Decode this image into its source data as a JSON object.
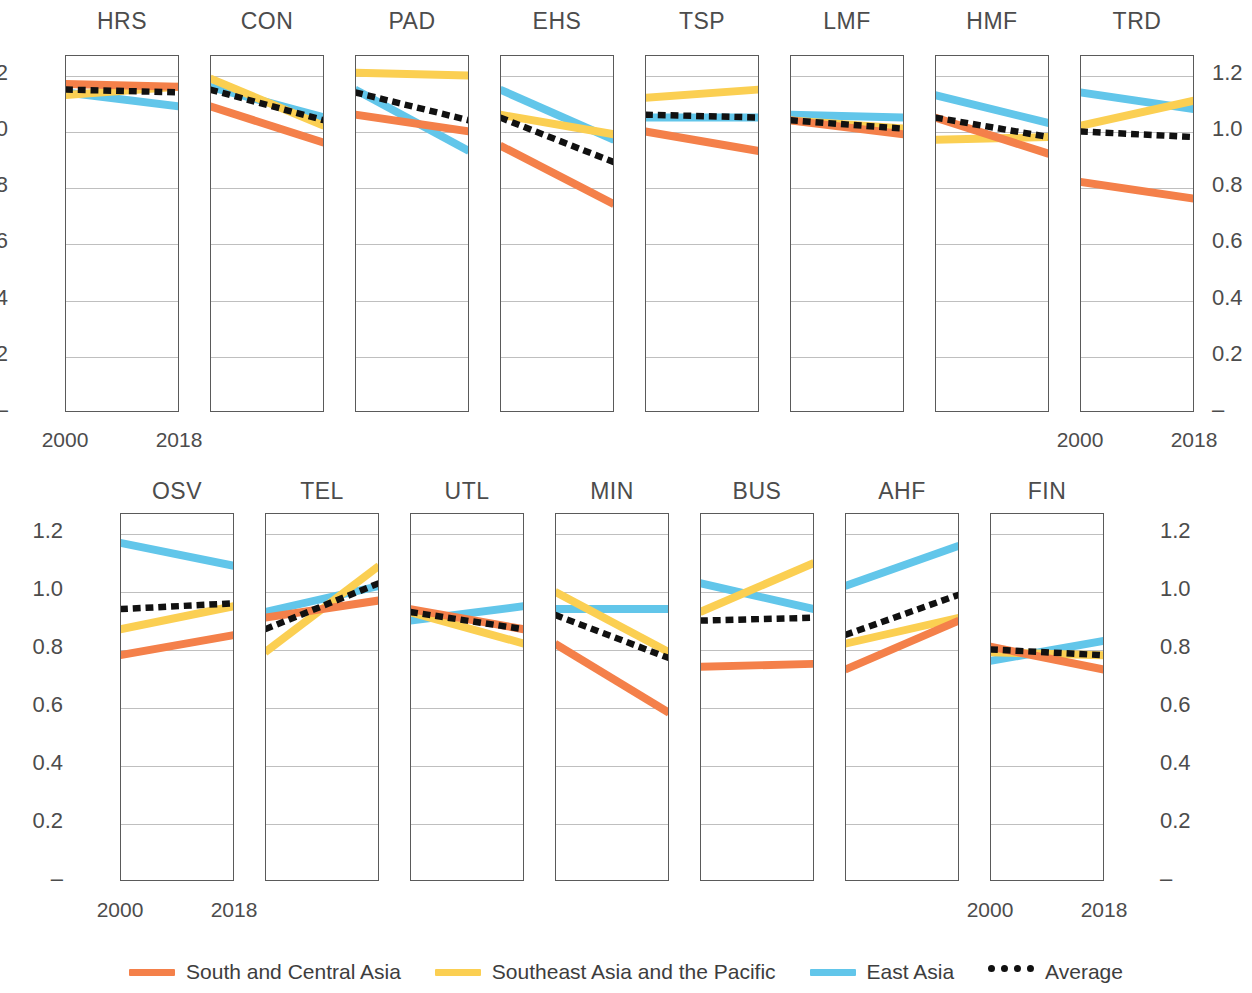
{
  "colors": {
    "south_central_asia": "#F4804A",
    "southeast_asia_pacific": "#FBCF52",
    "east_asia": "#62C6EA",
    "average": "#111111",
    "axis": "#5a5a5a",
    "grid": "#bfbfbf",
    "text": "#4c4c4c"
  },
  "axis": {
    "y_ticks": [
      "1.2",
      "1.0",
      "0.8",
      "0.6",
      "0.4",
      "0.2",
      "–"
    ],
    "y_values": [
      1.2,
      1.0,
      0.8,
      0.6,
      0.4,
      0.2,
      0.0
    ],
    "x_ticks": [
      "2000",
      "2018"
    ],
    "ylim": [
      0,
      1.27
    ],
    "xlim": [
      2000,
      2018
    ]
  },
  "legend": {
    "position": "bottom-center",
    "items": [
      {
        "label": "South and Central Asia",
        "color": "#F4804A",
        "style": "solid"
      },
      {
        "label": "Southeast Asia and the Pacific",
        "color": "#FBCF52",
        "style": "solid"
      },
      {
        "label": "East Asia",
        "color": "#62C6EA",
        "style": "solid"
      },
      {
        "label": "Average",
        "color": "#111111",
        "style": "dashed"
      }
    ]
  },
  "chart_data": {
    "type": "line",
    "title": "",
    "subtitle": "",
    "xlabel": "",
    "ylabel": "",
    "x": [
      2000,
      2018
    ],
    "xlim": [
      2000,
      2018
    ],
    "ylim": [
      0,
      1.27
    ],
    "grid": true,
    "legend_position": "bottom",
    "series_names": [
      "South and Central Asia",
      "Southeast Asia and the Pacific",
      "East Asia",
      "Average"
    ],
    "panel_layout": {
      "rows": 2,
      "row1_count": 8,
      "row2_count": 7
    },
    "panels": [
      {
        "name": "HRS",
        "row": 1,
        "series": [
          {
            "name": "South and Central Asia",
            "values": [
              1.17,
              1.16
            ]
          },
          {
            "name": "Southeast Asia and the Pacific",
            "values": [
              1.13,
              1.16
            ]
          },
          {
            "name": "East Asia",
            "values": [
              1.14,
              1.09
            ]
          },
          {
            "name": "Average",
            "values": [
              1.15,
              1.14
            ]
          }
        ]
      },
      {
        "name": "CON",
        "row": 1,
        "series": [
          {
            "name": "South and Central Asia",
            "values": [
              1.09,
              0.96
            ]
          },
          {
            "name": "Southeast Asia and the Pacific",
            "values": [
              1.19,
              1.02
            ]
          },
          {
            "name": "East Asia",
            "values": [
              1.16,
              1.05
            ]
          },
          {
            "name": "Average",
            "values": [
              1.15,
              1.04
            ]
          }
        ]
      },
      {
        "name": "PAD",
        "row": 1,
        "series": [
          {
            "name": "South and Central Asia",
            "values": [
              1.06,
              1.0
            ]
          },
          {
            "name": "Southeast Asia and the Pacific",
            "values": [
              1.21,
              1.2
            ]
          },
          {
            "name": "East Asia",
            "values": [
              1.15,
              0.93
            ]
          },
          {
            "name": "Average",
            "values": [
              1.14,
              1.04
            ]
          }
        ]
      },
      {
        "name": "EHS",
        "row": 1,
        "series": [
          {
            "name": "South and Central Asia",
            "values": [
              0.95,
              0.74
            ]
          },
          {
            "name": "Southeast Asia and the Pacific",
            "values": [
              1.06,
              0.99
            ]
          },
          {
            "name": "East Asia",
            "values": [
              1.15,
              0.97
            ]
          },
          {
            "name": "Average",
            "values": [
              1.05,
              0.89
            ]
          }
        ]
      },
      {
        "name": "TSP",
        "row": 1,
        "series": [
          {
            "name": "South and Central Asia",
            "values": [
              1.0,
              0.93
            ]
          },
          {
            "name": "Southeast Asia and the Pacific",
            "values": [
              1.12,
              1.15
            ]
          },
          {
            "name": "East Asia",
            "values": [
              1.05,
              1.05
            ]
          },
          {
            "name": "Average",
            "values": [
              1.06,
              1.05
            ]
          }
        ]
      },
      {
        "name": "LMF",
        "row": 1,
        "series": [
          {
            "name": "South and Central Asia",
            "values": [
              1.04,
              0.99
            ]
          },
          {
            "name": "Southeast Asia and the Pacific",
            "values": [
              1.04,
              1.01
            ]
          },
          {
            "name": "East Asia",
            "values": [
              1.06,
              1.05
            ]
          },
          {
            "name": "Average",
            "values": [
              1.04,
              1.01
            ]
          }
        ]
      },
      {
        "name": "HMF",
        "row": 1,
        "series": [
          {
            "name": "South and Central Asia",
            "values": [
              1.05,
              0.92
            ]
          },
          {
            "name": "Southeast Asia and the Pacific",
            "values": [
              0.97,
              0.98
            ]
          },
          {
            "name": "East Asia",
            "values": [
              1.13,
              1.03
            ]
          },
          {
            "name": "Average",
            "values": [
              1.05,
              0.98
            ]
          }
        ]
      },
      {
        "name": "TRD",
        "row": 1,
        "series": [
          {
            "name": "South and Central Asia",
            "values": [
              0.82,
              0.76
            ]
          },
          {
            "name": "Southeast Asia and the Pacific",
            "values": [
              1.02,
              1.11
            ]
          },
          {
            "name": "East Asia",
            "values": [
              1.14,
              1.08
            ]
          },
          {
            "name": "Average",
            "values": [
              1.0,
              0.98
            ]
          }
        ]
      },
      {
        "name": "OSV",
        "row": 2,
        "series": [
          {
            "name": "South and Central Asia",
            "values": [
              0.78,
              0.85
            ]
          },
          {
            "name": "Southeast Asia and the Pacific",
            "values": [
              0.87,
              0.95
            ]
          },
          {
            "name": "East Asia",
            "values": [
              1.17,
              1.09
            ]
          },
          {
            "name": "Average",
            "values": [
              0.94,
              0.96
            ]
          }
        ]
      },
      {
        "name": "TEL",
        "row": 2,
        "series": [
          {
            "name": "South and Central Asia",
            "values": [
              0.91,
              0.97
            ]
          },
          {
            "name": "Southeast Asia and the Pacific",
            "values": [
              0.79,
              1.09
            ]
          },
          {
            "name": "East Asia",
            "values": [
              0.93,
              1.02
            ]
          },
          {
            "name": "Average",
            "values": [
              0.87,
              1.03
            ]
          }
        ]
      },
      {
        "name": "UTL",
        "row": 2,
        "series": [
          {
            "name": "South and Central Asia",
            "values": [
              0.94,
              0.87
            ]
          },
          {
            "name": "Southeast Asia and the Pacific",
            "values": [
              0.93,
              0.82
            ]
          },
          {
            "name": "East Asia",
            "values": [
              0.9,
              0.95
            ]
          },
          {
            "name": "Average",
            "values": [
              0.93,
              0.87
            ]
          }
        ]
      },
      {
        "name": "MIN",
        "row": 2,
        "series": [
          {
            "name": "South and Central Asia",
            "values": [
              0.82,
              0.58
            ]
          },
          {
            "name": "Southeast Asia and the Pacific",
            "values": [
              1.0,
              0.79
            ]
          },
          {
            "name": "East Asia",
            "values": [
              0.94,
              0.94
            ]
          },
          {
            "name": "Average",
            "values": [
              0.92,
              0.77
            ]
          }
        ]
      },
      {
        "name": "BUS",
        "row": 2,
        "series": [
          {
            "name": "South and Central Asia",
            "values": [
              0.74,
              0.75
            ]
          },
          {
            "name": "Southeast Asia and the Pacific",
            "values": [
              0.93,
              1.1
            ]
          },
          {
            "name": "East Asia",
            "values": [
              1.03,
              0.94
            ]
          },
          {
            "name": "Average",
            "values": [
              0.9,
              0.91
            ]
          }
        ]
      },
      {
        "name": "AHF",
        "row": 2,
        "series": [
          {
            "name": "South and Central Asia",
            "values": [
              0.73,
              0.9
            ]
          },
          {
            "name": "Southeast Asia and the Pacific",
            "values": [
              0.82,
              0.91
            ]
          },
          {
            "name": "East Asia",
            "values": [
              1.02,
              1.16
            ]
          },
          {
            "name": "Average",
            "values": [
              0.85,
              0.99
            ]
          }
        ]
      },
      {
        "name": "FIN",
        "row": 2,
        "series": [
          {
            "name": "South and Central Asia",
            "values": [
              0.81,
              0.73
            ]
          },
          {
            "name": "Southeast Asia and the Pacific",
            "values": [
              0.79,
              0.78
            ]
          },
          {
            "name": "East Asia",
            "values": [
              0.76,
              0.83
            ]
          },
          {
            "name": "Average",
            "values": [
              0.8,
              0.78
            ]
          }
        ]
      }
    ]
  },
  "layout": {
    "row1": {
      "panel_top": 55,
      "panel_bottom": 412,
      "panel_width": 114,
      "panel_gap": 31,
      "first_left": 65,
      "title_y": 8,
      "xtick_y": 428,
      "left_ticks_x": 8,
      "right_ticks_x": 1212
    },
    "row2": {
      "panel_top": 513,
      "panel_bottom": 881,
      "panel_width": 114,
      "panel_gap": 31,
      "first_left": 120,
      "title_y": 478,
      "xtick_y": 898,
      "left_ticks_x": 63,
      "right_ticks_x": 1160
    }
  }
}
